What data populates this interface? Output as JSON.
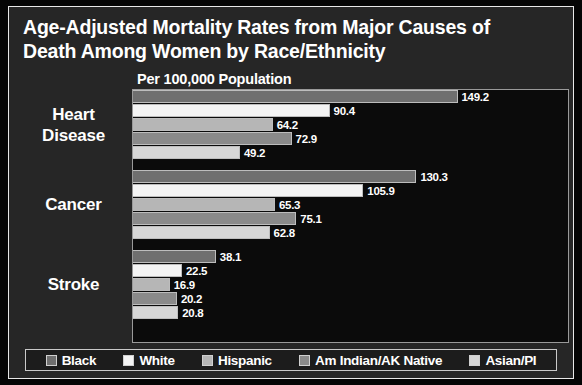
{
  "title": {
    "line1": "Age-Adjusted Mortality Rates from Major Causes of",
    "line2": "Death Among Women by Race/Ethnicity"
  },
  "subtitle": "Per 100,000 Population",
  "legend": {
    "items": [
      {
        "label": "Black",
        "color": "#6f6f6f"
      },
      {
        "label": "White",
        "color": "#f4f4f4"
      },
      {
        "label": "Hispanic",
        "color": "#b6b6b6"
      },
      {
        "label": "Am Indian/AK Native",
        "color": "#8a8a8a"
      },
      {
        "label": "Asian/PI",
        "color": "#d6d6d6"
      }
    ]
  },
  "categories": [
    {
      "label_line1": "Heart",
      "label_line2": "Disease"
    },
    {
      "label_line1": "Cancer",
      "label_line2": ""
    },
    {
      "label_line1": "Stroke",
      "label_line2": ""
    }
  ],
  "values": {
    "heart_disease": [
      "149.2",
      "90.4",
      "64.2",
      "72.9",
      "49.2"
    ],
    "cancer": [
      "130.3",
      "105.9",
      "65.3",
      "75.1",
      "62.8"
    ],
    "stroke": [
      "38.1",
      "22.5",
      "16.9",
      "20.2",
      "20.8"
    ]
  },
  "chart_data": {
    "type": "bar",
    "orientation": "horizontal",
    "title": "Age-Adjusted Mortality Rates from Major Causes of Death Among Women by Race/Ethnicity",
    "subtitle": "Per 100,000 Population",
    "xlabel": "",
    "ylabel": "",
    "categories": [
      "Heart Disease",
      "Cancer",
      "Stroke"
    ],
    "series": [
      {
        "name": "Black",
        "color": "#6f6f6f",
        "values": [
          149.2,
          130.3,
          38.1
        ]
      },
      {
        "name": "White",
        "color": "#f4f4f4",
        "values": [
          90.4,
          105.9,
          22.5
        ]
      },
      {
        "name": "Hispanic",
        "color": "#b6b6b6",
        "values": [
          64.2,
          65.3,
          16.9
        ]
      },
      {
        "name": "Am Indian/AK Native",
        "color": "#8a8a8a",
        "values": [
          72.9,
          75.1,
          20.2
        ]
      },
      {
        "name": "Asian/PI",
        "color": "#d6d6d6",
        "values": [
          49.2,
          62.8,
          20.8
        ]
      }
    ],
    "data_labels": true,
    "grid": false,
    "legend_position": "bottom",
    "xlim": [
      0,
      160
    ]
  }
}
